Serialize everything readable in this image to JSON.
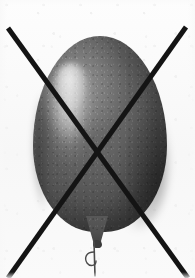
{
  "image": {
    "subject": "balloon",
    "annotation": "crossed-out",
    "meaning_label": "rejected",
    "width": 195,
    "height": 278,
    "rendering": "desaturated-photograph"
  },
  "colors": {
    "background": "#fbfbfb",
    "balloon_base": "#626262",
    "balloon_light": "#6e6e6e",
    "balloon_dark": "#4a4a4a",
    "balloon_shadow": "#3f3f3f",
    "highlight": "#e8e8e8",
    "knot": "#3a3a3a",
    "string": "#4a4a4a",
    "strike_line": "#141414"
  },
  "balloon": {
    "body": {
      "left": 33,
      "top": 36,
      "width": 134,
      "height": 196,
      "shape": "teardrop-oval"
    },
    "neck": {
      "left": 86,
      "top": 216,
      "width": 22,
      "height": 30
    },
    "highlight": {
      "name": "specular-highlight",
      "position": "upper-left",
      "left": 48,
      "top": 62,
      "width": 46,
      "height": 122
    },
    "knot": {
      "left": 93,
      "top": 240,
      "width": 9,
      "height": 8
    },
    "string": {
      "description": "thin vertical string with small curled loop at left",
      "path": "M 20 6 L 21 40",
      "curl_path": "M 20 16 C 12 16, 10 22, 13 27 C 16 31, 22 30, 22 25",
      "stroke_width": 1.6,
      "curl_stroke_width": 1.4
    }
  },
  "strike": {
    "name": "cross-out-x",
    "stroke_width": 5,
    "line_1": {
      "name": "diagonal-down-right",
      "x1": 8,
      "y1": 28,
      "x2": 188,
      "y2": 278
    },
    "line_2": {
      "name": "diagonal-up-right",
      "x1": 8,
      "y1": 278,
      "x2": 186,
      "y2": 27
    },
    "intersection": {
      "x": 97,
      "y": 149
    }
  }
}
